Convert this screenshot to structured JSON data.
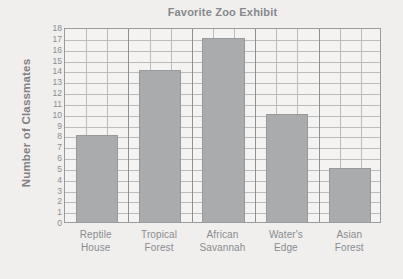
{
  "chart_data": {
    "type": "bar",
    "title": "Favorite Zoo Exhibit",
    "xlabel": "",
    "ylabel": "Number of Classmates",
    "categories": [
      "Reptile House",
      "Tropical Forest",
      "African Savannah",
      "Water's Edge",
      "Asian Forest"
    ],
    "category_lines": [
      [
        "Reptile",
        "House"
      ],
      [
        "Tropical",
        "Forest"
      ],
      [
        "African",
        "Savannah"
      ],
      [
        "Water's",
        "Edge"
      ],
      [
        "Asian",
        "Forest"
      ]
    ],
    "values": [
      8,
      14,
      17,
      10,
      5
    ],
    "ylim": [
      0,
      18
    ],
    "ytick_step": 1,
    "yticks": [
      18,
      17,
      16,
      15,
      14,
      13,
      12,
      11,
      10,
      9,
      8,
      7,
      6,
      5,
      4,
      3,
      2,
      1,
      0
    ],
    "grid": true,
    "grid_columns": 15,
    "legend": null,
    "colors": {
      "background": "#f0efee",
      "plot_background": "#f4f3f2",
      "bar_fill": "#a9abad",
      "bar_edge": "#97999b",
      "grid_line": "#b9bbbd",
      "grid_line_major": "#8e9092",
      "axis_line": "#9a9c9e",
      "title_text": "#87898b",
      "label_text": "#8a8c8e"
    }
  }
}
